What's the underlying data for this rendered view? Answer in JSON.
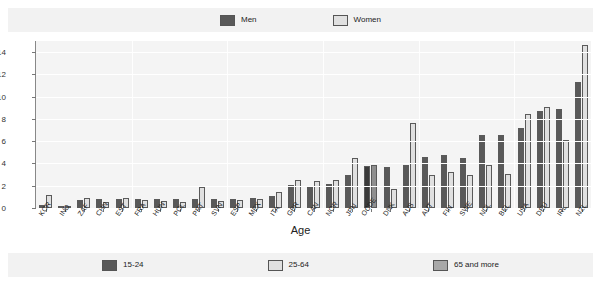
{
  "legend_top": {
    "entries": [
      {
        "label": "Men",
        "color": "#595959"
      },
      {
        "label": "Women",
        "color": "#e0e0e0"
      }
    ]
  },
  "legend_bottom": {
    "entries": [
      {
        "label": "15-24",
        "color": "#595959"
      },
      {
        "label": "25-64",
        "color": "#e0e0e0"
      },
      {
        "label": "65 and more",
        "color": "#a8a8a8"
      }
    ]
  },
  "chart_data": {
    "type": "bar",
    "title": "",
    "xlabel": "Age",
    "ylabel": "",
    "ylim": [
      0,
      15
    ],
    "yticks": [
      0,
      2,
      4,
      6,
      8,
      10,
      12,
      14
    ],
    "grid": true,
    "legend_position": "top-and-bottom",
    "categories": [
      "KOR",
      "IND",
      "ZAF",
      "CHN",
      "EST",
      "FRA",
      "HUN",
      "POL",
      "PRT",
      "SVN",
      "ESP",
      "MEX",
      "ITA",
      "GBR",
      "CAN",
      "NOR",
      "JPN",
      "OCDE",
      "DNK",
      "AUS",
      "AUT",
      "FIN",
      "SWE",
      "NDL",
      "BEL",
      "USA",
      "DEU",
      "IRL",
      "NZL"
    ],
    "series": [
      {
        "name": "Men",
        "color": "#595959",
        "values": [
          0.3,
          0.2,
          0.7,
          0.8,
          0.8,
          0.8,
          0.8,
          0.8,
          0.8,
          0.8,
          0.8,
          0.9,
          1.1,
          2.1,
          1.9,
          2.2,
          3.0,
          3.8,
          3.7,
          3.9,
          4.6,
          4.8,
          4.5,
          6.6,
          6.6,
          7.2,
          8.7,
          8.9,
          11.3
        ]
      },
      {
        "name": "Women",
        "color": "#e0e0e0",
        "values": [
          1.2,
          0.1,
          0.9,
          0.5,
          0.9,
          0.7,
          0.6,
          0.5,
          1.9,
          0.6,
          0.7,
          0.8,
          1.4,
          2.5,
          2.4,
          2.5,
          4.5,
          3.9,
          1.7,
          7.6,
          3.0,
          3.2,
          3.0,
          3.9,
          3.1,
          8.4,
          9.1,
          6.1,
          14.6
        ]
      }
    ],
    "highlight_category": "OCDE"
  }
}
